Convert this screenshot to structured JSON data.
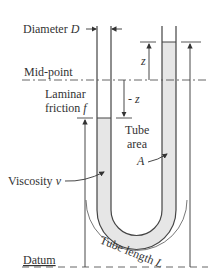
{
  "labels": {
    "diameter": "Diameter ",
    "diameter_symbol": "D",
    "midpoint": "Mid-point",
    "laminar": "Laminar",
    "friction": "friction ",
    "friction_symbol": "f",
    "z": "z",
    "minus_z": "- z",
    "tube": "Tube",
    "area": "area",
    "area_symbol": "A",
    "viscosity": "Viscosity ",
    "viscosity_symbol": "v",
    "tube_length": "Tube length ",
    "tube_length_symbol": "L",
    "datum": "Datum"
  },
  "colors": {
    "fluid": "#e6e6e6",
    "line": "#444444"
  }
}
